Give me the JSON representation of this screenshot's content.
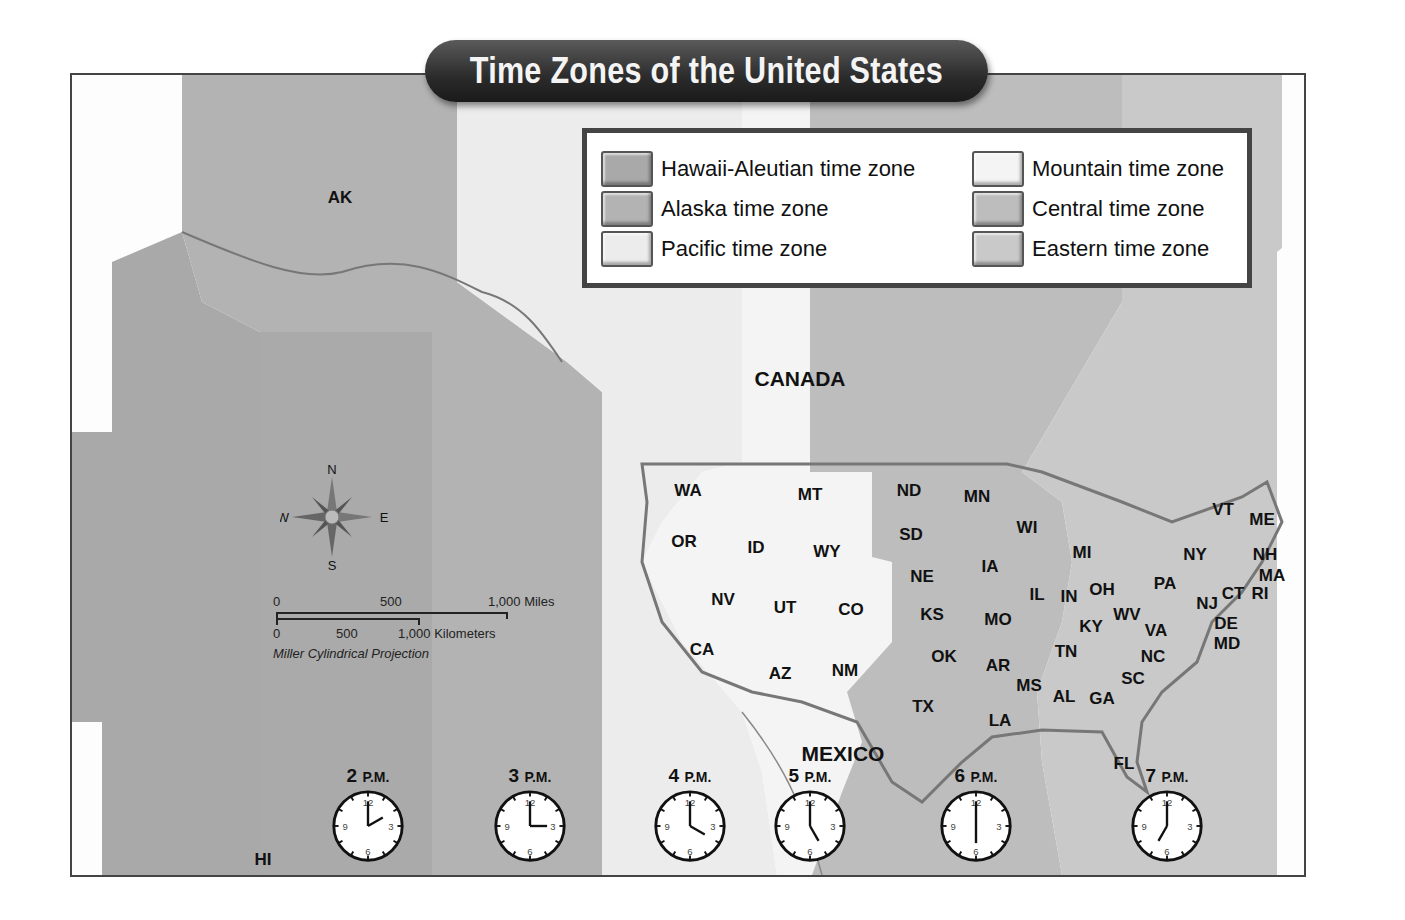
{
  "title": "Time Zones of the United States",
  "legend": {
    "items": [
      {
        "label": "Hawaii-Aleutian time zone",
        "color": "#a9a9a9"
      },
      {
        "label": "Alaska time zone",
        "color": "#b3b3b3"
      },
      {
        "label": "Pacific time zone",
        "color": "#ececec"
      },
      {
        "label": "Mountain time zone",
        "color": "#f4f4f4"
      },
      {
        "label": "Central time zone",
        "color": "#bdbdbd"
      },
      {
        "label": "Eastern time zone",
        "color": "#c9c9c9"
      }
    ]
  },
  "regions": {
    "ak": "AK",
    "hi": "HI",
    "canada": "CANADA",
    "mexico": "MEXICO"
  },
  "states": [
    {
      "abbr": "WA",
      "x": 688,
      "y": 491
    },
    {
      "abbr": "OR",
      "x": 684,
      "y": 542
    },
    {
      "abbr": "ID",
      "x": 756,
      "y": 548
    },
    {
      "abbr": "MT",
      "x": 810,
      "y": 495
    },
    {
      "abbr": "WY",
      "x": 827,
      "y": 552
    },
    {
      "abbr": "ND",
      "x": 909,
      "y": 491
    },
    {
      "abbr": "SD",
      "x": 911,
      "y": 535
    },
    {
      "abbr": "NE",
      "x": 922,
      "y": 577
    },
    {
      "abbr": "NV",
      "x": 723,
      "y": 600
    },
    {
      "abbr": "UT",
      "x": 785,
      "y": 608
    },
    {
      "abbr": "CO",
      "x": 851,
      "y": 610
    },
    {
      "abbr": "KS",
      "x": 932,
      "y": 615
    },
    {
      "abbr": "CA",
      "x": 702,
      "y": 650
    },
    {
      "abbr": "AZ",
      "x": 780,
      "y": 674
    },
    {
      "abbr": "NM",
      "x": 845,
      "y": 671
    },
    {
      "abbr": "OK",
      "x": 944,
      "y": 657
    },
    {
      "abbr": "TX",
      "x": 923,
      "y": 707
    },
    {
      "abbr": "MN",
      "x": 977,
      "y": 497
    },
    {
      "abbr": "WI",
      "x": 1027,
      "y": 528
    },
    {
      "abbr": "IA",
      "x": 990,
      "y": 567
    },
    {
      "abbr": "IL",
      "x": 1037,
      "y": 595
    },
    {
      "abbr": "MO",
      "x": 998,
      "y": 620
    },
    {
      "abbr": "AR",
      "x": 998,
      "y": 666
    },
    {
      "abbr": "LA",
      "x": 1000,
      "y": 721
    },
    {
      "abbr": "MS",
      "x": 1029,
      "y": 686
    },
    {
      "abbr": "AL",
      "x": 1064,
      "y": 697
    },
    {
      "abbr": "GA",
      "x": 1102,
      "y": 699
    },
    {
      "abbr": "MI",
      "x": 1082,
      "y": 553
    },
    {
      "abbr": "IN",
      "x": 1069,
      "y": 597
    },
    {
      "abbr": "OH",
      "x": 1102,
      "y": 590
    },
    {
      "abbr": "KY",
      "x": 1091,
      "y": 627
    },
    {
      "abbr": "TN",
      "x": 1066,
      "y": 652
    },
    {
      "abbr": "WV",
      "x": 1127,
      "y": 615
    },
    {
      "abbr": "VA",
      "x": 1156,
      "y": 631
    },
    {
      "abbr": "NC",
      "x": 1153,
      "y": 657
    },
    {
      "abbr": "SC",
      "x": 1133,
      "y": 679
    },
    {
      "abbr": "FL",
      "x": 1124,
      "y": 764
    },
    {
      "abbr": "PA",
      "x": 1165,
      "y": 584
    },
    {
      "abbr": "NY",
      "x": 1195,
      "y": 555
    },
    {
      "abbr": "VT",
      "x": 1223,
      "y": 510
    },
    {
      "abbr": "ME",
      "x": 1262,
      "y": 520
    },
    {
      "abbr": "NH",
      "x": 1265,
      "y": 555
    },
    {
      "abbr": "MA",
      "x": 1272,
      "y": 576
    },
    {
      "abbr": "RI",
      "x": 1260,
      "y": 594
    },
    {
      "abbr": "CT",
      "x": 1233,
      "y": 594
    },
    {
      "abbr": "NJ",
      "x": 1207,
      "y": 604
    },
    {
      "abbr": "DE",
      "x": 1226,
      "y": 624
    },
    {
      "abbr": "MD",
      "x": 1227,
      "y": 644
    }
  ],
  "compass": {
    "n": "N",
    "s": "S",
    "e": "E",
    "w": "W"
  },
  "scale": {
    "miles_ticks": [
      "0",
      "500",
      "1,000 Miles"
    ],
    "km_ticks": [
      "0",
      "500",
      "1,000 Kilometers"
    ],
    "projection": "Miller Cylindrical Projection"
  },
  "clocks": [
    {
      "hour": "2",
      "suffix": "P.M.",
      "x": 368,
      "zone": "Hawaii-Aleutian"
    },
    {
      "hour": "3",
      "suffix": "P.M.",
      "x": 530,
      "zone": "Alaska"
    },
    {
      "hour": "4",
      "suffix": "P.M.",
      "x": 690,
      "zone": "Pacific"
    },
    {
      "hour": "5",
      "suffix": "P.M.",
      "x": 810,
      "zone": "Mountain"
    },
    {
      "hour": "6",
      "suffix": "P.M.",
      "x": 976,
      "zone": "Central"
    },
    {
      "hour": "7",
      "suffix": "P.M.",
      "x": 1167,
      "zone": "Eastern"
    }
  ],
  "clock_numerals": [
    "12",
    "3",
    "6",
    "9"
  ]
}
